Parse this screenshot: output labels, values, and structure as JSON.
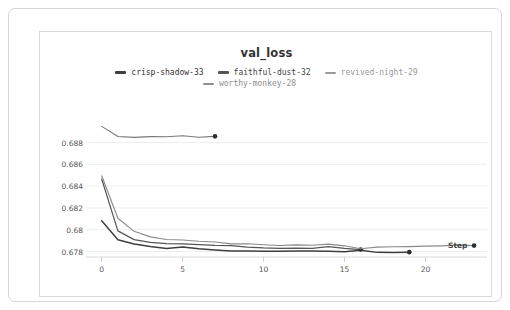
{
  "chart_data": {
    "type": "line",
    "title": "val_loss",
    "xlabel": "Step",
    "ylabel": "",
    "xlim": [
      -0.6,
      23.8
    ],
    "ylim": [
      0.6775,
      0.6897
    ],
    "grid": true,
    "legend_position": "top-center",
    "x_ticks": [
      "0",
      "5",
      "10",
      "15",
      "20"
    ],
    "x_tick_values": [
      0,
      5,
      10,
      15,
      20
    ],
    "y_ticks": [
      "0.688",
      "0.686",
      "0.684",
      "0.682",
      "0.68",
      "0.678"
    ],
    "y_tick_values": [
      0.688,
      0.686,
      0.684,
      0.682,
      0.68,
      0.678
    ],
    "series": [
      {
        "name": "crisp-shadow-33",
        "color": "#3f3f3f",
        "width": 1.5,
        "end_marker": true,
        "x": [
          0,
          1,
          2,
          3,
          4,
          5,
          6,
          7,
          8,
          9,
          10,
          11,
          12,
          13,
          14,
          15,
          16,
          17,
          18,
          19
        ],
        "values": [
          0.68082,
          0.67909,
          0.678695,
          0.678455,
          0.678285,
          0.678425,
          0.678255,
          0.678135,
          0.678045,
          0.678055,
          0.678035,
          0.678035,
          0.678045,
          0.678055,
          0.678035,
          0.677985,
          0.678125,
          0.677925,
          0.677915,
          0.677945
        ]
      },
      {
        "name": "faithful-dust-32",
        "color": "#555555",
        "width": 1.2,
        "end_marker": true,
        "x": [
          0,
          1,
          2,
          3,
          4,
          5,
          6,
          7,
          8,
          9,
          10,
          11,
          12,
          13,
          14,
          15,
          16
        ],
        "values": [
          0.68465,
          0.679895,
          0.679095,
          0.678835,
          0.678725,
          0.678705,
          0.678635,
          0.678565,
          0.678545,
          0.678415,
          0.678335,
          0.678295,
          0.678315,
          0.678295,
          0.678445,
          0.678295,
          0.678185
        ]
      },
      {
        "name": "revived-night-29",
        "color": "#8a8a8a",
        "width": 1.1,
        "end_marker": true,
        "x": [
          0,
          1,
          2,
          3,
          4,
          5,
          6,
          7,
          8,
          9,
          10,
          11,
          12,
          13,
          14,
          15,
          16,
          17,
          18,
          19,
          20,
          21,
          22,
          23
        ],
        "values": [
          0.68495,
          0.681055,
          0.679855,
          0.679345,
          0.679105,
          0.679055,
          0.678945,
          0.678875,
          0.678705,
          0.678715,
          0.678625,
          0.678555,
          0.678615,
          0.678575,
          0.678685,
          0.678525,
          0.678255,
          0.678405,
          0.678435,
          0.678455,
          0.678495,
          0.678525,
          0.678585,
          0.678545
        ]
      },
      {
        "name": "worthy-monkey-28",
        "color": "#777777",
        "width": 1.1,
        "end_marker": true,
        "x": [
          0,
          1,
          2,
          3,
          4,
          5,
          6,
          7
        ],
        "values": [
          0.68948,
          0.688555,
          0.688475,
          0.688545,
          0.688525,
          0.688625,
          0.688485,
          0.688565
        ]
      }
    ]
  },
  "legend": {
    "row1": [
      {
        "label": "crisp-shadow-33",
        "color": "#3f3f3f",
        "text_color": "#333333"
      },
      {
        "label": "faithful-dust-32",
        "color": "#555555",
        "text_color": "#444444"
      },
      {
        "label": "revived-night-29",
        "color": "#9a9a9a",
        "text_color": "#999999"
      }
    ],
    "row2": [
      {
        "label": "worthy-monkey-28",
        "color": "#8f8f8f",
        "text_color": "#8d8d8d"
      }
    ]
  }
}
